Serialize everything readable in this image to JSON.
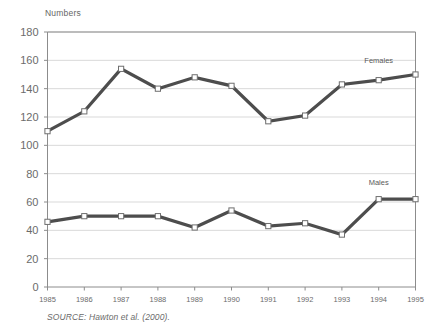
{
  "chart_data": {
    "type": "line",
    "title": "",
    "subtitle": "",
    "ylabel": "Numbers",
    "xlabel": "",
    "x": [
      "1985",
      "1986",
      "1987",
      "1988",
      "1989",
      "1990",
      "1991",
      "1992",
      "1993",
      "1994",
      "1995"
    ],
    "categories": [
      "1985",
      "1986",
      "1987",
      "1988",
      "1989",
      "1990",
      "1991",
      "1992",
      "1993",
      "1994",
      "1995"
    ],
    "series": [
      {
        "name": "Females",
        "values": [
          110,
          124,
          154,
          140,
          148,
          142,
          117,
          121,
          143,
          146,
          150
        ],
        "color": "#4d4d4d"
      },
      {
        "name": "Males",
        "values": [
          46,
          50,
          50,
          50,
          42,
          54,
          43,
          45,
          37,
          62,
          62
        ],
        "color": "#4d4d4d"
      }
    ],
    "ylim": [
      0,
      180
    ],
    "y_ticks": [
      0,
      20,
      40,
      60,
      80,
      100,
      120,
      140,
      160,
      180
    ],
    "y_tick_labels": [
      "0",
      "20",
      "40",
      "60",
      "80",
      "100",
      "120",
      "140",
      "160",
      "180"
    ],
    "grid": true,
    "grid_axis": "y",
    "grid_color": "#d9d9d9",
    "legend_position": "inline-annotation",
    "annotations": [
      {
        "text": "Females",
        "x": "1994",
        "y": 158
      },
      {
        "text": "Males",
        "x": "1994",
        "y": 72
      }
    ],
    "marker": "open-square",
    "marker_face_color": "#ffffff",
    "marker_edge_color": "#6e6e6e",
    "line_width": 3.2,
    "axis_color": "#8c8c8c"
  },
  "source": {
    "note": "SOURCE: Hawton et al. (2000)."
  }
}
